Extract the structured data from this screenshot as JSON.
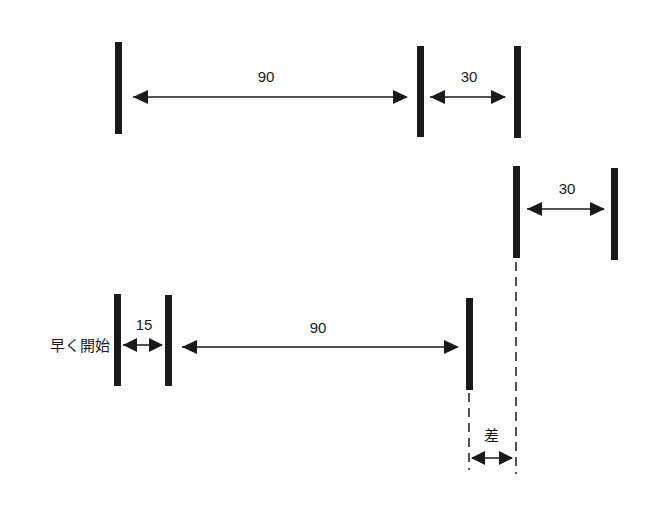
{
  "diagram": {
    "type": "schedule-timeline",
    "row1": {
      "segment_a_label": "90",
      "segment_b_label": "30"
    },
    "row2": {
      "segment_label": "30"
    },
    "row3": {
      "start_label": "早く開始",
      "lead_label": "15",
      "segment_label": "90"
    },
    "difference_label": "差"
  },
  "colors": {
    "ink": "#1a1a1a",
    "background": "#ffffff"
  }
}
